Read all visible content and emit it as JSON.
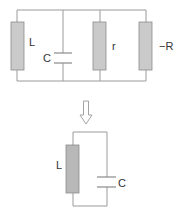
{
  "diagram": {
    "type": "circuit-equivalence",
    "colors": {
      "wire": "#9a9a9a",
      "resistor_fill": "#cacaca",
      "inductor_fill_bottom": "#b8b8b8",
      "label": "#333333"
    },
    "top_circuit": {
      "description": "Parallel circuit of L, C, r and -R",
      "components": [
        {
          "id": "L",
          "kind": "inductor",
          "label": "L"
        },
        {
          "id": "C",
          "kind": "capacitor",
          "label": "C"
        },
        {
          "id": "r",
          "kind": "resistor",
          "label": "r"
        },
        {
          "id": "negR",
          "kind": "negative-resistor",
          "label": "−R"
        }
      ]
    },
    "arrow": {
      "direction": "down",
      "style": "hollow"
    },
    "bottom_circuit": {
      "description": "Equivalent LC tank circuit",
      "components": [
        {
          "id": "L",
          "kind": "inductor",
          "label": "L"
        },
        {
          "id": "C",
          "kind": "capacitor",
          "label": "C"
        }
      ]
    }
  }
}
